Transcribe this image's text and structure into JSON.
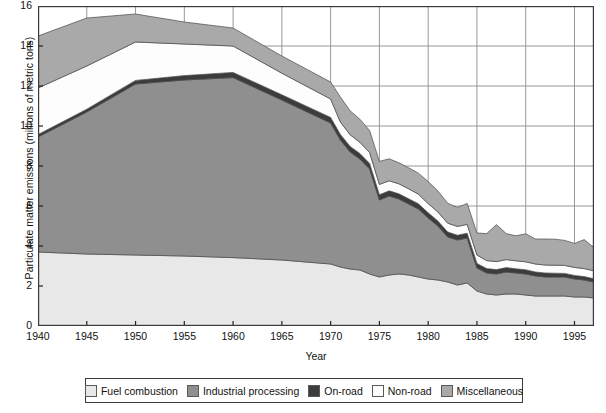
{
  "chart_data": {
    "type": "area",
    "stacked": true,
    "title": "",
    "xlabel": "Year",
    "ylabel": "Particulate matter emissions (millions of metric tons)",
    "xlim": [
      1940,
      1997
    ],
    "ylim": [
      0,
      16
    ],
    "yticks": [
      0,
      2,
      4,
      6,
      8,
      10,
      12,
      14,
      16
    ],
    "xticks": [
      1940,
      1945,
      1950,
      1955,
      1960,
      1965,
      1970,
      1975,
      1980,
      1985,
      1990,
      1995
    ],
    "grid": true,
    "legend_position": "bottom",
    "x": [
      1940,
      1945,
      1950,
      1955,
      1960,
      1965,
      1970,
      1971,
      1972,
      1973,
      1974,
      1975,
      1976,
      1977,
      1978,
      1979,
      1980,
      1981,
      1982,
      1983,
      1984,
      1985,
      1986,
      1987,
      1988,
      1989,
      1990,
      1991,
      1992,
      1993,
      1994,
      1995,
      1996,
      1997
    ],
    "series": [
      {
        "name": "Fuel combustion",
        "color": "#e8e8e8",
        "values": [
          3.7,
          3.6,
          3.55,
          3.5,
          3.42,
          3.3,
          3.1,
          2.95,
          2.85,
          2.8,
          2.6,
          2.45,
          2.55,
          2.6,
          2.55,
          2.45,
          2.35,
          2.3,
          2.2,
          2.05,
          2.15,
          1.75,
          1.6,
          1.55,
          1.6,
          1.6,
          1.55,
          1.5,
          1.5,
          1.5,
          1.5,
          1.45,
          1.45,
          1.4
        ]
      },
      {
        "name": "Industrial processing",
        "color": "#8f8f8f",
        "values": [
          5.75,
          7.1,
          8.55,
          8.8,
          9.0,
          8.0,
          7.05,
          6.35,
          5.85,
          5.55,
          5.25,
          3.85,
          3.95,
          3.75,
          3.55,
          3.4,
          3.05,
          2.7,
          2.25,
          2.25,
          2.25,
          1.15,
          1.05,
          1.05,
          1.1,
          1.05,
          1.05,
          1.0,
          0.95,
          0.95,
          0.95,
          0.9,
          0.85,
          0.8
        ]
      },
      {
        "name": "On-road",
        "color": "#3c3c3c",
        "values": [
          0.12,
          0.14,
          0.18,
          0.22,
          0.26,
          0.26,
          0.28,
          0.28,
          0.28,
          0.28,
          0.28,
          0.26,
          0.26,
          0.26,
          0.26,
          0.26,
          0.26,
          0.25,
          0.25,
          0.24,
          0.24,
          0.23,
          0.22,
          0.22,
          0.22,
          0.21,
          0.21,
          0.2,
          0.2,
          0.19,
          0.18,
          0.18,
          0.17,
          0.16
        ]
      },
      {
        "name": "Non-road",
        "color": "#fdfdfd",
        "values": [
          2.33,
          2.16,
          1.92,
          1.58,
          1.32,
          1.08,
          0.92,
          0.62,
          0.58,
          0.56,
          0.54,
          0.52,
          0.5,
          0.5,
          0.5,
          0.48,
          0.46,
          0.45,
          0.44,
          0.44,
          0.44,
          0.42,
          0.4,
          0.4,
          0.4,
          0.4,
          0.4,
          0.4,
          0.4,
          0.4,
          0.4,
          0.4,
          0.4,
          0.4
        ]
      },
      {
        "name": "Miscellaneous",
        "color": "#a9a9a9",
        "values": [
          2.6,
          2.4,
          1.4,
          1.1,
          0.9,
          0.86,
          0.85,
          1.25,
          1.2,
          1.15,
          1.1,
          1.15,
          1.1,
          1.05,
          1.05,
          1.05,
          1.1,
          1.05,
          1.0,
          0.95,
          1.05,
          1.1,
          1.35,
          1.85,
          1.3,
          1.25,
          1.4,
          1.25,
          1.3,
          1.3,
          1.25,
          1.2,
          1.45,
          1.15
        ]
      }
    ]
  },
  "legend": {
    "items": [
      {
        "label": "Fuel combustion"
      },
      {
        "label": "Industrial processing"
      },
      {
        "label": "On-road"
      },
      {
        "label": "Non-road"
      },
      {
        "label": "Miscellaneous"
      }
    ]
  }
}
